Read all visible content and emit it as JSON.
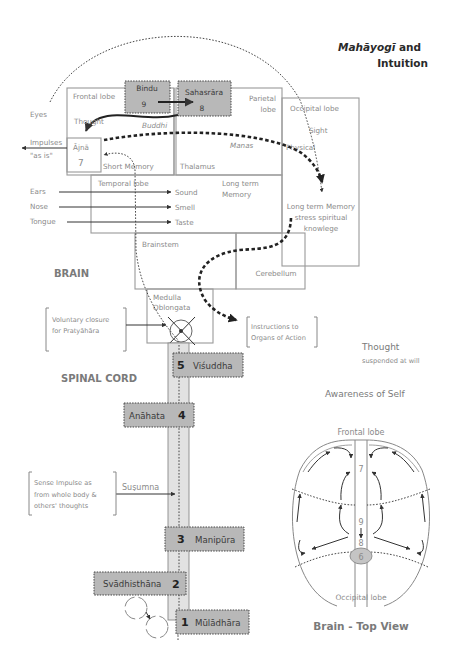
{
  "title": {
    "line1_italic": "Mahāyogī",
    "line1_rest": " and",
    "line2": "Intuition"
  },
  "brain": {
    "section_label": "BRAIN",
    "frontal_lobe": "Frontal lobe",
    "thought": "Thought",
    "buddhi": "Buddhi",
    "parietal_lobe_1": "Parietal",
    "parietal_lobe_2": "lobe",
    "occipital_lobe": "Occipital lobe",
    "sight": "Sight",
    "physical": "Physical",
    "manas": "Manas",
    "thalamus": "Thalamus",
    "short_memory": "Short Memory",
    "temporal_lobe": "Temporal lobe",
    "long_term_1": "Long term",
    "long_term_2": "Memory",
    "ltm_spiritual_1": "Long term Memory",
    "ltm_spiritual_2": "stress spiritual",
    "ltm_spiritual_3": "knowlege",
    "brainstem": "Brainstem",
    "cerebellum": "Cerebellum",
    "medulla_1": "Medulla",
    "medulla_2": "Oblongata"
  },
  "senses": {
    "eyes": "Eyes",
    "impulses_1": "Impulses",
    "impulses_2": "\"as is\"",
    "ears": "Ears",
    "nose": "Nose",
    "tongue": "Tongue",
    "sound": "Sound",
    "smell": "Smell",
    "taste": "Taste"
  },
  "chakras": [
    {
      "number": "9",
      "name": "Bindu"
    },
    {
      "number": "8",
      "name": "Sahasrāra"
    },
    {
      "number": "7",
      "name": "Ājnā"
    },
    {
      "number": "6",
      "name": ""
    },
    {
      "number": "5",
      "name": "Viśuddha"
    },
    {
      "number": "4",
      "name": "Anāhata"
    },
    {
      "number": "3",
      "name": "Manipūra"
    },
    {
      "number": "2",
      "name": "Svādhisthāna"
    },
    {
      "number": "1",
      "name": "Mūlādhāra"
    }
  ],
  "spinal": {
    "section_label": "SPINAL CORD",
    "susumna": "Suṣumna",
    "voluntary_1": "Voluntary closure",
    "voluntary_2": "for Pratyāhāra",
    "instructions_1": "Instructions to",
    "instructions_2": "Organs of Action",
    "sense_1": "Sense Impulse as",
    "sense_2": "from whole body &",
    "sense_3": "others' thoughts"
  },
  "right_notes": {
    "thought": "Thought",
    "suspended": "suspended at will",
    "awareness": "Awareness of Self"
  },
  "top_view": {
    "frontal_lobe": "Frontal lobe",
    "occipital_lobe": "Occipital lobe",
    "n7": "7",
    "n9": "9",
    "n8": "8",
    "n6": "6",
    "caption": "Brain - Top View"
  }
}
